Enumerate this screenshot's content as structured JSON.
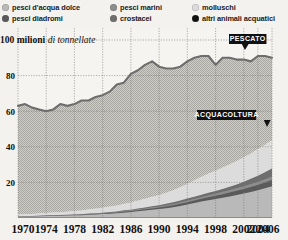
{
  "legend": {
    "items": [
      {
        "label": "pesci d'acqua dolce",
        "color": "#b9b9b9"
      },
      {
        "label": "pesci diadromi",
        "color": "#5a5a5a"
      },
      {
        "label": "pesci marini",
        "color": "#8d8d8d"
      },
      {
        "label": "crostacei",
        "color": "#6e6e6e"
      },
      {
        "label": "molluschi",
        "color": "#dcdcdc"
      },
      {
        "label": "altri animali acquatici",
        "color": "#111111"
      }
    ]
  },
  "chart_data": {
    "type": "area",
    "title_bold": "100 milioni",
    "title_italic": "di tonnellate",
    "ylabel": "milioni di tonnellate",
    "xlabel": "",
    "ylim": [
      0,
      100
    ],
    "yticks": [
      20,
      40,
      60,
      80,
      100
    ],
    "grid": true,
    "legend_position": "top",
    "xticklabels": [
      "1970",
      "1974",
      "1978",
      "1982",
      "1986",
      "1990",
      "1994",
      "1998",
      "2002",
      "2004",
      "2006"
    ],
    "xtickvalues": [
      1970,
      1974,
      1978,
      1982,
      1986,
      1990,
      1994,
      1998,
      2002,
      2004,
      2006
    ],
    "x": [
      1970,
      1971,
      1972,
      1973,
      1974,
      1975,
      1976,
      1977,
      1978,
      1979,
      1980,
      1981,
      1982,
      1983,
      1984,
      1985,
      1986,
      1987,
      1988,
      1989,
      1990,
      1991,
      1992,
      1993,
      1994,
      1995,
      1996,
      1997,
      1998,
      1999,
      2000,
      2001,
      2002,
      2003,
      2004,
      2005,
      2006
    ],
    "annotations": [
      {
        "text": "PESCATO",
        "x": 2004,
        "y": 93
      },
      {
        "text": "ACQUACOLTURA",
        "x": 2000,
        "y": 52
      }
    ],
    "series": [
      {
        "name": "pesci d'acqua dolce",
        "color": "#b9b9b9",
        "values": [
          0.8,
          0.9,
          0.9,
          1.0,
          1.1,
          1.2,
          1.3,
          1.4,
          1.5,
          1.6,
          1.8,
          2.0,
          2.2,
          2.4,
          2.7,
          3.0,
          3.4,
          3.8,
          4.2,
          4.6,
          5.0,
          5.5,
          6.1,
          6.8,
          7.6,
          8.4,
          9.2,
          10.0,
          10.7,
          11.4,
          12.1,
          12.9,
          13.7,
          14.6,
          15.6,
          16.7,
          17.9
        ]
      },
      {
        "name": "pesci diadromi",
        "color": "#5a5a5a",
        "values": [
          0.1,
          0.1,
          0.1,
          0.1,
          0.1,
          0.2,
          0.2,
          0.2,
          0.2,
          0.2,
          0.3,
          0.3,
          0.3,
          0.4,
          0.4,
          0.5,
          0.5,
          0.6,
          0.7,
          0.8,
          0.9,
          1.0,
          1.1,
          1.2,
          1.3,
          1.4,
          1.6,
          1.7,
          1.8,
          2.0,
          2.2,
          2.4,
          2.6,
          2.8,
          3.0,
          3.2,
          3.4
        ]
      },
      {
        "name": "pesci marini",
        "color": "#8d8d8d",
        "values": [
          0.1,
          0.1,
          0.1,
          0.1,
          0.1,
          0.1,
          0.1,
          0.1,
          0.2,
          0.2,
          0.2,
          0.2,
          0.3,
          0.3,
          0.3,
          0.4,
          0.4,
          0.5,
          0.5,
          0.6,
          0.6,
          0.7,
          0.7,
          0.8,
          0.9,
          1.0,
          1.0,
          1.1,
          1.2,
          1.3,
          1.4,
          1.5,
          1.6,
          1.7,
          1.8,
          1.9,
          2.0
        ]
      },
      {
        "name": "crostacei",
        "color": "#6e6e6e",
        "values": [
          0.0,
          0.0,
          0.0,
          0.0,
          0.1,
          0.1,
          0.1,
          0.1,
          0.1,
          0.1,
          0.2,
          0.2,
          0.2,
          0.3,
          0.3,
          0.4,
          0.4,
          0.5,
          0.5,
          0.6,
          0.7,
          0.8,
          0.9,
          1.0,
          1.1,
          1.2,
          1.3,
          1.4,
          1.5,
          1.6,
          1.8,
          2.0,
          2.4,
          2.9,
          3.4,
          3.9,
          4.5
        ]
      },
      {
        "name": "molluschi",
        "color": "#dcdcdc",
        "values": [
          1.0,
          1.1,
          1.2,
          1.3,
          1.4,
          1.5,
          1.6,
          1.7,
          1.9,
          2.1,
          2.3,
          2.5,
          2.7,
          2.9,
          3.2,
          3.5,
          3.9,
          4.3,
          4.7,
          5.1,
          5.5,
          6.0,
          6.6,
          7.3,
          8.1,
          8.9,
          9.7,
          10.4,
          11.0,
          11.6,
          12.2,
          12.7,
          13.2,
          13.7,
          14.2,
          14.7,
          15.2
        ]
      },
      {
        "name": "altri animali acquatici",
        "color": "#111111",
        "values": [
          0.0,
          0.0,
          0.0,
          0.0,
          0.0,
          0.0,
          0.0,
          0.0,
          0.0,
          0.0,
          0.0,
          0.1,
          0.1,
          0.1,
          0.1,
          0.1,
          0.1,
          0.1,
          0.2,
          0.2,
          0.2,
          0.2,
          0.2,
          0.3,
          0.3,
          0.3,
          0.4,
          0.4,
          0.4,
          0.5,
          0.5,
          0.5,
          0.6,
          0.6,
          0.7,
          0.7,
          0.8
        ]
      }
    ],
    "total_line": {
      "name": "PESCATO",
      "color": "#6d6d6d",
      "values": [
        63,
        64,
        62,
        61,
        60,
        61,
        64,
        63,
        64,
        66,
        66,
        68,
        69,
        71,
        75,
        76,
        81,
        83,
        86,
        88,
        85,
        84,
        84,
        85,
        88,
        90,
        91,
        91,
        86,
        90,
        90,
        89,
        89,
        88,
        91,
        91,
        90
      ]
    }
  }
}
